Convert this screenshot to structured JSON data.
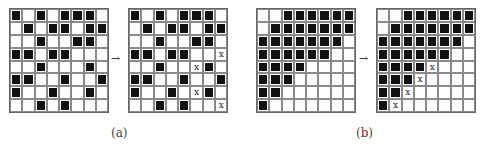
{
  "figure": {
    "panels": [
      {
        "id": "a",
        "label": "(a)",
        "arrow": "→",
        "before": [
          "10101110",
          "01011011",
          "00100110",
          "11011000",
          "00100010",
          "11001001",
          "10010010",
          "00101000"
        ],
        "after": [
          "10101110",
          "01011011",
          "00100110",
          "1101100x",
          "00100x10",
          "11001001",
          "10010x10",
          "0010100x"
        ]
      },
      {
        "id": "b",
        "label": "(b)",
        "arrow": "→",
        "before": [
          "00111111",
          "01111111",
          "11111110",
          "11111100",
          "11110000",
          "11100000",
          "11000000",
          "10000000"
        ],
        "after": [
          "00111111",
          "01111111",
          "11111110",
          "11111100",
          "1111x000",
          "111x0000",
          "11x00000",
          "1x000000"
        ]
      }
    ],
    "mark_symbol": "x"
  }
}
